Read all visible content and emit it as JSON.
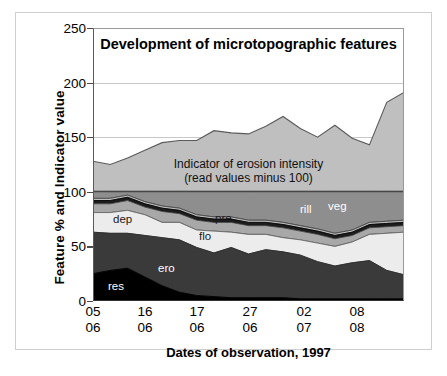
{
  "figure": {
    "title": "Development of microtopographic features",
    "annotation_line1": "Indicator of erosion intensity",
    "annotation_line2": "(read values minus 100)"
  },
  "axes": {
    "ylabel": "Feature % and Indicator value",
    "xlabel": "Dates of observation, 1997",
    "yticks": [
      "0",
      "50",
      "100",
      "150",
      "200",
      "250"
    ],
    "xticks": [
      {
        "day": "05",
        "month": "06"
      },
      {
        "day": "16",
        "month": "06"
      },
      {
        "day": "17",
        "month": "06"
      },
      {
        "day": "27",
        "month": "06"
      },
      {
        "day": "02",
        "month": "07"
      },
      {
        "day": "08",
        "month": "08"
      }
    ]
  },
  "series_labels": {
    "res": "res",
    "ero": "ero",
    "flo": "flo",
    "pre": "pre",
    "dep": "dep",
    "rill": "rill",
    "veg": "veg"
  },
  "colors": {
    "res": "#000000",
    "ero": "#3a3a3a",
    "flo": "#ececec",
    "pre": "#a8a8a8",
    "dep": "#1c1c1c",
    "rill": "#bdbdbd",
    "veg": "#8e8e8e",
    "indicator": "#bfbfbf",
    "plot_background": "#ffffff",
    "gridline": "#c8c8c8",
    "axis": "#333333"
  },
  "chart_data": {
    "type": "area",
    "title": "Development of microtopographic features",
    "xlabel": "Dates of observation, 1997",
    "ylabel": "Feature % and Indicator value",
    "ylim": [
      0,
      250
    ],
    "yticks": [
      0,
      50,
      100,
      150,
      200,
      250
    ],
    "grid": true,
    "legend": "inline-labels",
    "stacked": true,
    "note": "Lower stack (res+ero+flo+pre+dep+rill+veg) sums to 100%. The upper band is the erosion-intensity indicator plotted above 100; read its value as the plotted value minus 100.",
    "x": [
      1,
      2,
      3,
      4,
      5,
      6,
      7,
      8,
      9,
      10,
      11,
      12,
      13,
      14,
      15,
      16,
      17,
      18,
      19
    ],
    "x_tick_positions": [
      1,
      4,
      7,
      10,
      13,
      16
    ],
    "x_tick_labels": [
      "05 06",
      "16 06",
      "17 06",
      "27 06",
      "02 07",
      "08 08"
    ],
    "series": [
      {
        "name": "res",
        "label": "res",
        "values": [
          25,
          28,
          30,
          22,
          14,
          8,
          5,
          4,
          3,
          3,
          3,
          3,
          2,
          2,
          2,
          2,
          2,
          2,
          2
        ]
      },
      {
        "name": "ero",
        "label": "ero",
        "values": [
          38,
          34,
          32,
          38,
          44,
          48,
          44,
          40,
          46,
          40,
          44,
          42,
          40,
          34,
          30,
          33,
          35,
          26,
          22
        ]
      },
      {
        "name": "flo",
        "label": "flo",
        "values": [
          18,
          19,
          21,
          19,
          14,
          16,
          16,
          20,
          14,
          18,
          14,
          13,
          14,
          17,
          18,
          19,
          24,
          34,
          39
        ]
      },
      {
        "name": "pre",
        "label": "pre",
        "values": [
          8,
          8,
          9,
          7,
          10,
          8,
          9,
          8,
          9,
          8,
          8,
          9,
          8,
          8,
          7,
          6,
          6,
          6,
          6
        ]
      },
      {
        "name": "dep",
        "label": "dep",
        "values": [
          3,
          3,
          3,
          3,
          3,
          3,
          3,
          3,
          3,
          3,
          3,
          3,
          3,
          3,
          3,
          3,
          3,
          3,
          3
        ]
      },
      {
        "name": "rill",
        "label": "rill",
        "values": [
          2,
          2,
          2,
          2,
          2,
          2,
          2,
          2,
          2,
          2,
          2,
          2,
          2,
          2,
          2,
          2,
          2,
          2,
          2
        ]
      },
      {
        "name": "veg",
        "label": "veg",
        "values": [
          6,
          6,
          3,
          9,
          13,
          15,
          21,
          23,
          23,
          26,
          26,
          28,
          31,
          34,
          38,
          35,
          28,
          27,
          26
        ]
      },
      {
        "name": "indicator",
        "label": "Indicator of erosion intensity",
        "values": [
          128,
          125,
          131,
          138,
          145,
          147,
          147,
          156,
          154,
          153,
          160,
          169,
          158,
          150,
          161,
          149,
          143,
          182,
          191
        ]
      }
    ]
  }
}
